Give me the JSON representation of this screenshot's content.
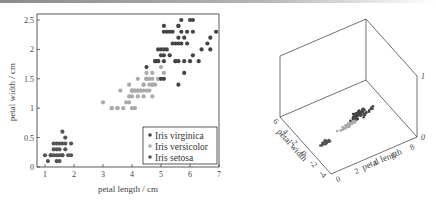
{
  "chart_data": [
    {
      "type": "scatter",
      "title": "",
      "xlabel": "petal length / cm",
      "ylabel": "petal width / cm",
      "xlim": [
        0.8,
        7.0
      ],
      "ylim": [
        0,
        2.6
      ],
      "xticks": [
        "1",
        "2",
        "3",
        "4",
        "5",
        "6",
        "7"
      ],
      "yticks": [
        "0",
        "0.5",
        "1",
        "1.5",
        "2",
        "2.5"
      ],
      "grid": false,
      "legend_position": "lower right",
      "series": [
        {
          "name": "Iris virginica",
          "color": "#444444",
          "points": [
            [
              6.0,
              2.5
            ],
            [
              5.1,
              1.9
            ],
            [
              5.9,
              2.1
            ],
            [
              5.6,
              1.8
            ],
            [
              5.8,
              2.2
            ],
            [
              6.6,
              2.1
            ],
            [
              4.5,
              1.7
            ],
            [
              6.3,
              1.8
            ],
            [
              5.8,
              1.8
            ],
            [
              6.1,
              2.5
            ],
            [
              5.1,
              2.0
            ],
            [
              5.3,
              1.9
            ],
            [
              5.5,
              2.1
            ],
            [
              5.0,
              2.0
            ],
            [
              5.1,
              2.4
            ],
            [
              5.3,
              2.3
            ],
            [
              5.5,
              1.8
            ],
            [
              6.7,
              2.2
            ],
            [
              6.9,
              2.3
            ],
            [
              5.0,
              1.5
            ],
            [
              5.7,
              2.3
            ],
            [
              4.9,
              2.0
            ],
            [
              6.7,
              2.0
            ],
            [
              4.9,
              1.8
            ],
            [
              5.7,
              2.1
            ],
            [
              6.0,
              1.8
            ],
            [
              4.8,
              1.8
            ],
            [
              4.9,
              1.8
            ],
            [
              5.6,
              2.1
            ],
            [
              5.8,
              1.6
            ],
            [
              6.1,
              1.9
            ],
            [
              6.4,
              2.0
            ],
            [
              5.6,
              2.2
            ],
            [
              5.1,
              1.5
            ],
            [
              5.6,
              1.4
            ],
            [
              6.1,
              2.3
            ],
            [
              5.6,
              2.4
            ],
            [
              5.5,
              1.8
            ],
            [
              4.8,
              1.8
            ],
            [
              5.4,
              2.1
            ],
            [
              5.6,
              2.4
            ],
            [
              5.1,
              2.3
            ],
            [
              5.9,
              2.3
            ],
            [
              5.7,
              2.5
            ],
            [
              5.2,
              2.3
            ],
            [
              5.0,
              1.9
            ],
            [
              5.2,
              2.0
            ],
            [
              5.4,
              2.3
            ],
            [
              5.1,
              1.8
            ]
          ]
        },
        {
          "name": "Iris versicolor",
          "color": "#aaaaaa",
          "points": [
            [
              4.7,
              1.4
            ],
            [
              4.5,
              1.5
            ],
            [
              4.9,
              1.5
            ],
            [
              4.0,
              1.3
            ],
            [
              4.6,
              1.5
            ],
            [
              4.5,
              1.3
            ],
            [
              4.7,
              1.6
            ],
            [
              3.3,
              1.0
            ],
            [
              4.6,
              1.3
            ],
            [
              3.9,
              1.4
            ],
            [
              3.5,
              1.0
            ],
            [
              4.2,
              1.5
            ],
            [
              4.0,
              1.0
            ],
            [
              4.7,
              1.4
            ],
            [
              3.6,
              1.3
            ],
            [
              4.4,
              1.4
            ],
            [
              4.5,
              1.5
            ],
            [
              4.1,
              1.0
            ],
            [
              4.5,
              1.5
            ],
            [
              3.9,
              1.1
            ],
            [
              4.8,
              1.8
            ],
            [
              4.0,
              1.3
            ],
            [
              4.9,
              1.5
            ],
            [
              4.7,
              1.2
            ],
            [
              4.3,
              1.3
            ],
            [
              4.4,
              1.4
            ],
            [
              4.8,
              1.4
            ],
            [
              5.0,
              1.7
            ],
            [
              4.5,
              1.5
            ],
            [
              3.5,
              1.0
            ],
            [
              3.8,
              1.1
            ],
            [
              3.7,
              1.0
            ],
            [
              3.9,
              1.2
            ],
            [
              5.1,
              1.6
            ],
            [
              4.5,
              1.5
            ],
            [
              4.5,
              1.6
            ],
            [
              4.7,
              1.5
            ],
            [
              4.4,
              1.3
            ],
            [
              4.1,
              1.3
            ],
            [
              4.0,
              1.3
            ],
            [
              4.4,
              1.2
            ],
            [
              4.6,
              1.4
            ],
            [
              4.0,
              1.2
            ],
            [
              3.3,
              1.0
            ],
            [
              4.2,
              1.3
            ],
            [
              4.2,
              1.2
            ],
            [
              4.2,
              1.3
            ],
            [
              4.3,
              1.3
            ],
            [
              3.0,
              1.1
            ],
            [
              4.1,
              1.3
            ]
          ]
        },
        {
          "name": "Iris setosa",
          "color": "#555555",
          "points": [
            [
              1.4,
              0.2
            ],
            [
              1.3,
              0.2
            ],
            [
              1.5,
              0.2
            ],
            [
              1.7,
              0.4
            ],
            [
              1.4,
              0.3
            ],
            [
              1.5,
              0.1
            ],
            [
              1.6,
              0.2
            ],
            [
              1.1,
              0.1
            ],
            [
              1.2,
              0.2
            ],
            [
              1.5,
              0.4
            ],
            [
              1.3,
              0.4
            ],
            [
              1.7,
              0.3
            ],
            [
              1.0,
              0.2
            ],
            [
              1.7,
              0.5
            ],
            [
              1.9,
              0.2
            ],
            [
              1.6,
              0.4
            ],
            [
              1.4,
              0.1
            ],
            [
              1.6,
              0.6
            ],
            [
              1.9,
              0.4
            ],
            [
              1.3,
              0.3
            ],
            [
              1.6,
              0.2
            ],
            [
              1.5,
              0.3
            ],
            [
              1.2,
              0.2
            ],
            [
              1.4,
              0.4
            ],
            [
              1.8,
              0.2
            ]
          ]
        }
      ]
    },
    {
      "type": "scatter3d",
      "xlabel": "petal length",
      "ylabel": "petal width",
      "zlabel": "",
      "xlim": [
        0,
        8
      ],
      "ylim": [
        -4,
        6
      ],
      "zlim": [
        0,
        1
      ],
      "xticks": [
        "0",
        "2",
        "4",
        "6",
        "8"
      ],
      "yticks": [
        "6",
        "4",
        "2",
        "0",
        "-2",
        "-4"
      ],
      "zticks": [
        "0",
        "1"
      ],
      "grid": false,
      "series_note": "same three species plotted at z=0; virginica dark, versicolor light grey, setosa dark"
    }
  ],
  "legend": {
    "items": [
      {
        "label": "Iris virginica",
        "color": "#444444"
      },
      {
        "label": "Iris versicolor",
        "color": "#aaaaaa"
      },
      {
        "label": "Iris setosa",
        "color": "#555555"
      }
    ]
  },
  "plot3d": {
    "x_label": "petal length",
    "y_label": "petal width",
    "x_ticks": [
      "0",
      "2",
      "4",
      "6",
      "8"
    ],
    "y_ticks": [
      "6",
      "4",
      "2",
      "0",
      "-2",
      "-4"
    ],
    "z_ticks": [
      "0",
      "1"
    ]
  },
  "plot2d": {
    "x_label": "petal length / cm",
    "y_label": "petal width / cm",
    "x_ticks": [
      "1",
      "2",
      "3",
      "4",
      "5",
      "6",
      "7"
    ],
    "y_ticks": [
      "0",
      "0.5",
      "1",
      "1.5",
      "2",
      "2.5"
    ]
  }
}
